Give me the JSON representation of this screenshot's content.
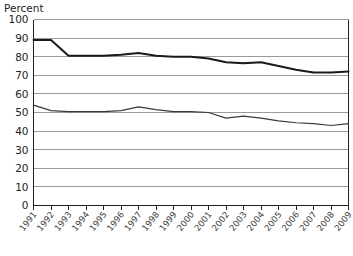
{
  "chart_data": {
    "type": "line",
    "title": "",
    "ylabel": "Percent",
    "xlabel": "",
    "ylim": [
      0,
      100
    ],
    "ytick_step": 10,
    "grid": true,
    "legend": "none",
    "categories": [
      "1991",
      "1992",
      "1993",
      "1994",
      "1995",
      "1996",
      "1997",
      "1998",
      "1999",
      "2000",
      "2001",
      "2002",
      "2003",
      "2004",
      "2005",
      "2006",
      "2007",
      "2008",
      "2009"
    ],
    "yticks": [
      "0",
      "10",
      "20",
      "30",
      "40",
      "50",
      "60",
      "70",
      "80",
      "90",
      "100"
    ],
    "series": [
      {
        "name": "upper-series",
        "color": "#1a1a1a",
        "stroke_width": 2.0,
        "values": [
          89,
          89,
          80.5,
          80.5,
          80.5,
          81,
          82,
          80.5,
          80,
          80,
          79,
          77,
          76.5,
          77,
          75,
          73,
          71.5,
          71.5,
          72
        ]
      },
      {
        "name": "lower-series",
        "color": "#3a3a3a",
        "stroke_width": 1.2,
        "values": [
          54,
          51,
          50.5,
          50.5,
          50.5,
          51,
          53,
          51.5,
          50.5,
          50.5,
          50,
          47,
          48,
          47,
          45.5,
          44.5,
          44,
          43,
          44
        ]
      }
    ]
  },
  "axis": {
    "y_title": "Percent"
  },
  "footer": {
    "caption_sliver": ""
  }
}
